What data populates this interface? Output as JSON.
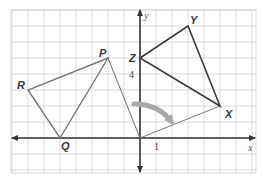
{
  "diagram": {
    "type": "coordinate-plane-rotation",
    "grid": {
      "x_min": -8,
      "x_max": 7,
      "y_min": -2,
      "y_max": 8,
      "unit_px": 16,
      "origin_px": [
        140,
        138
      ]
    },
    "axes": {
      "x_label": "x",
      "y_label": "y",
      "x_tick_label": "1",
      "x_tick_value": 1,
      "y_tick_label": "4",
      "y_tick_value": 4
    },
    "preimage": {
      "name": "triangle-PQR",
      "vertices": [
        {
          "label": "P",
          "x": -2,
          "y": 5
        },
        {
          "label": "Q",
          "x": -5,
          "y": 0
        },
        {
          "label": "R",
          "x": -7,
          "y": 3
        }
      ]
    },
    "image": {
      "name": "triangle-XYZ",
      "vertices": [
        {
          "label": "X",
          "x": 5,
          "y": 2
        },
        {
          "label": "Y",
          "x": 3,
          "y": 7
        },
        {
          "label": "Z",
          "x": 0,
          "y": 5
        }
      ]
    },
    "rotation_rays": [
      {
        "from": "O",
        "to": "P"
      },
      {
        "from": "O",
        "to": "X"
      }
    ],
    "rotation_arrow": "clockwise",
    "colors": {
      "grid": "#d6d6d6",
      "axes": "#333333",
      "preimage": "#777777",
      "image": "#3a3a3a",
      "ray": "#6a6a6a",
      "arrow": "#a8a8a8"
    }
  }
}
